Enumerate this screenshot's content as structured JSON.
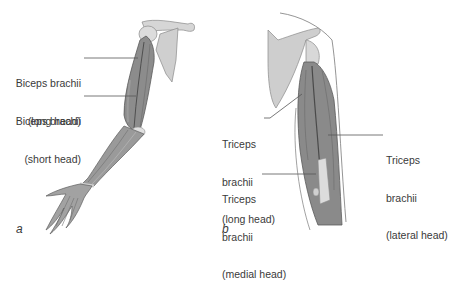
{
  "figure": {
    "panel_a": {
      "letter": "a",
      "view": "anterior arm",
      "labels": [
        {
          "line1": "Biceps brachii",
          "line2": "(long head)"
        },
        {
          "line1": "Biceps brachii",
          "line2": "(short head)"
        }
      ]
    },
    "panel_b": {
      "letter": "b",
      "view": "posterior arm",
      "labels": [
        {
          "line1": "Triceps",
          "line2": "brachii",
          "line3": "(long head)"
        },
        {
          "line1": "Triceps",
          "line2": "brachii",
          "line3": "(medial head)"
        },
        {
          "line1": "Triceps",
          "line2": "brachii",
          "line3": "(lateral head)"
        }
      ]
    },
    "colors": {
      "muscle": "#8a8a8a",
      "muscle_dark": "#5e5e5e",
      "bone": "#d2d2d2",
      "outline": "#6a6a6a",
      "text": "#3a3a3a",
      "leader": "#555555"
    }
  }
}
